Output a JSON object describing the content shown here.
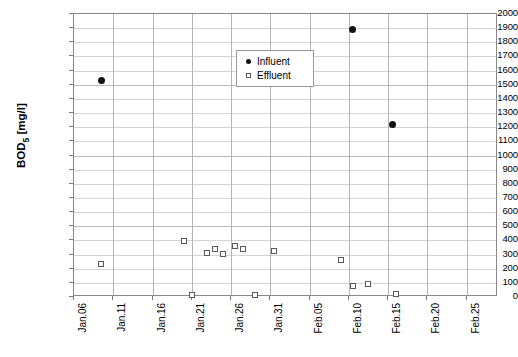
{
  "chart_data": {
    "type": "scatter",
    "title": "",
    "xlabel": "",
    "ylabel": "BOD5 [mg/l]",
    "ylabel_base": "BOD",
    "ylabel_sub": "5",
    "ylabel_unit": " [mg/l]",
    "ylim": [
      0,
      2000
    ],
    "ytick_step": 100,
    "grid": true,
    "legend_position": "upper-center",
    "x_tick_labels": [
      "Jan.06",
      "Jan.11",
      "Jan.16",
      "Jan.21",
      "Jan.26",
      "Jan.31",
      "Feb.05",
      "Feb.10",
      "Feb.15",
      "Feb.20",
      "Feb.25"
    ],
    "y_tick_labels": [
      "2000",
      "1900",
      "1800",
      "1700",
      "1600",
      "1500",
      "1400",
      "1300",
      "1200",
      "1100",
      "1000",
      "900",
      "800",
      "700",
      "600",
      "500",
      "400",
      "300",
      "200",
      "100",
      "0"
    ],
    "series": [
      {
        "name": "Influent",
        "marker": "filled-circle",
        "color": "#111111",
        "points": [
          {
            "x": "Jan.09",
            "x_days": 3.5,
            "y": 1527
          },
          {
            "x": "Feb.10",
            "x_days": 35.5,
            "y": 1887
          },
          {
            "x": "Feb.15",
            "x_days": 40.5,
            "y": 1216
          }
        ]
      },
      {
        "name": "Effluent",
        "marker": "open-square",
        "color": "#5a5a5a",
        "points": [
          {
            "x": "Jan.09",
            "x_days": 3.5,
            "y": 233
          },
          {
            "x": "Jan.20",
            "x_days": 14.0,
            "y": 396
          },
          {
            "x": "Jan.21",
            "x_days": 15.0,
            "y": 14
          },
          {
            "x": "Jan.23",
            "x_days": 17.0,
            "y": 311
          },
          {
            "x": "Jan.24",
            "x_days": 18.0,
            "y": 339
          },
          {
            "x": "Jan.25",
            "x_days": 19.0,
            "y": 304
          },
          {
            "x": "Jan.26",
            "x_days": 20.5,
            "y": 360
          },
          {
            "x": "Jan.27",
            "x_days": 21.5,
            "y": 339
          },
          {
            "x": "Jan.28",
            "x_days": 23.0,
            "y": 14
          },
          {
            "x": "Jan.30",
            "x_days": 25.5,
            "y": 325
          },
          {
            "x": "Feb.09",
            "x_days": 34.0,
            "y": 261
          },
          {
            "x": "Feb.10",
            "x_days": 35.5,
            "y": 78
          },
          {
            "x": "Feb.12",
            "x_days": 37.5,
            "y": 92
          },
          {
            "x": "Feb.15",
            "x_days": 41.0,
            "y": 21
          }
        ]
      }
    ]
  },
  "legend": {
    "items": [
      {
        "label": "Influent",
        "marker": "filled-circle"
      },
      {
        "label": "Effluent",
        "marker": "open-square"
      }
    ]
  },
  "caption": {
    "text": ""
  }
}
